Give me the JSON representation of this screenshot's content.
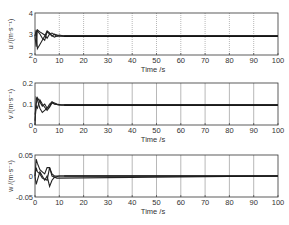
{
  "chart_data": [
    {
      "type": "line",
      "title": "",
      "xlabel": "Time /s",
      "ylabel": "u /(m·s⁻¹)",
      "xlim": [
        0,
        100
      ],
      "ylim": [
        2,
        4
      ],
      "xticks": [
        "0",
        "10",
        "20",
        "30",
        "40",
        "50",
        "60",
        "70",
        "80",
        "90",
        "100"
      ],
      "yticks": [
        "2",
        "3",
        "4"
      ],
      "grid": "vertical dotted",
      "steady_state": 2.9,
      "series": [
        {
          "name": "trace-1",
          "x": [
            0,
            0.5,
            1,
            2,
            3,
            4,
            5,
            6,
            7,
            8,
            10,
            12,
            100
          ],
          "values": [
            2.9,
            3.2,
            2.3,
            2.5,
            2.7,
            2.9,
            3.15,
            3.05,
            2.9,
            3.0,
            2.92,
            2.9,
            2.9
          ]
        },
        {
          "name": "trace-2",
          "x": [
            0,
            0.5,
            1,
            2,
            3,
            4,
            5,
            6,
            8,
            10,
            12,
            100
          ],
          "values": [
            2.9,
            3.1,
            3.15,
            3.0,
            2.8,
            2.7,
            3.1,
            3.0,
            2.85,
            2.95,
            2.9,
            2.9
          ]
        },
        {
          "name": "trace-3",
          "x": [
            0,
            0.5,
            1,
            2,
            4,
            5,
            6,
            7,
            9,
            11,
            100
          ],
          "values": [
            2.9,
            2.4,
            3.2,
            3.1,
            2.95,
            2.8,
            3.0,
            3.05,
            2.9,
            2.9,
            2.9
          ]
        }
      ]
    },
    {
      "type": "line",
      "title": "",
      "xlabel": "Time /s",
      "ylabel": "v /(m·s⁻¹)",
      "xlim": [
        0,
        100
      ],
      "ylim": [
        0,
        0.2
      ],
      "xticks": [
        "0",
        "10",
        "20",
        "30",
        "40",
        "50",
        "60",
        "70",
        "80",
        "90",
        "100"
      ],
      "yticks": [
        "0",
        "0.1",
        "0.2"
      ],
      "grid": "vertical solid",
      "steady_state": 0.095,
      "series": [
        {
          "name": "trace-1",
          "x": [
            0,
            0.5,
            1,
            2,
            3,
            4,
            5,
            6,
            7,
            8,
            10,
            12,
            100
          ],
          "values": [
            0,
            0.13,
            0.12,
            0.08,
            0.06,
            0.07,
            0.08,
            0.1,
            0.11,
            0.1,
            0.095,
            0.095,
            0.095
          ]
        },
        {
          "name": "trace-2",
          "x": [
            0,
            0.5,
            1,
            2,
            3,
            4,
            5,
            6,
            7,
            9,
            11,
            100
          ],
          "values": [
            0.02,
            0.1,
            0.13,
            0.11,
            0.09,
            0.1,
            0.08,
            0.09,
            0.11,
            0.1,
            0.095,
            0.095
          ]
        },
        {
          "name": "trace-3",
          "x": [
            0,
            0.5,
            1,
            2,
            3,
            5,
            6,
            7,
            8,
            10,
            100
          ],
          "values": [
            0.05,
            0.09,
            0.08,
            0.12,
            0.1,
            0.07,
            0.085,
            0.105,
            0.1,
            0.095,
            0.095
          ]
        }
      ]
    },
    {
      "type": "line",
      "title": "",
      "xlabel": "Time /s",
      "ylabel": "w /(m·s⁻¹)",
      "xlim": [
        0,
        100
      ],
      "ylim": [
        -0.05,
        0.05
      ],
      "xticks": [
        "0",
        "10",
        "20",
        "30",
        "40",
        "50",
        "60",
        "70",
        "80",
        "90",
        "100"
      ],
      "yticks": [
        "-0.05",
        "0",
        "0.05"
      ],
      "grid": "vertical solid",
      "steady_state": 0,
      "series": [
        {
          "name": "trace-1",
          "x": [
            0,
            0.5,
            1,
            2,
            3,
            4,
            5,
            6,
            7,
            8,
            10,
            100
          ],
          "values": [
            0,
            0.04,
            0.03,
            0.015,
            0.01,
            0.005,
            0.02,
            0.02,
            0.005,
            0,
            0,
            0
          ]
        },
        {
          "name": "trace-2",
          "x": [
            0,
            0.5,
            1,
            2,
            3,
            4,
            5,
            6,
            7,
            8,
            10,
            100
          ],
          "values": [
            0,
            -0.02,
            -0.01,
            0.01,
            0.0,
            -0.01,
            0.0,
            -0.025,
            -0.01,
            -0.003,
            0,
            0
          ]
        },
        {
          "name": "trace-3",
          "x": [
            0,
            0.5,
            1,
            2,
            3,
            5,
            6,
            7,
            9,
            100
          ],
          "values": [
            0,
            0.02,
            0.01,
            0.005,
            -0.005,
            -0.01,
            0.02,
            0.0,
            -0.005,
            0
          ]
        }
      ]
    }
  ]
}
